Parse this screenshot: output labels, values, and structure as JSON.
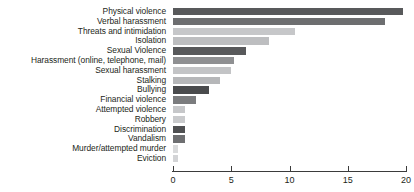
{
  "chart_data": {
    "type": "bar",
    "orientation": "horizontal",
    "title": "",
    "subtitle": "",
    "xlabel": "",
    "ylabel": "",
    "xlim": [
      0,
      20
    ],
    "grid": false,
    "legend": "none",
    "xticks": [
      "0",
      "5",
      "10",
      "15",
      "20"
    ],
    "xtick_values": [
      0,
      5,
      10,
      15,
      20
    ],
    "categories": [
      "Physical violence",
      "Verbal harassment",
      "Threats and intimidation",
      "Isolation",
      "Sexual Violence",
      "Harassment (online, telephone, mail)",
      "Sexual harassment",
      "Stalking",
      "Bullying",
      "Financial violence",
      "Attempted violence",
      "Robbery",
      "Discrimination",
      "Vandalism",
      "Murder/attempted murder",
      "Eviction"
    ],
    "values": [
      19.7,
      18.2,
      10.5,
      8.2,
      6.3,
      5.2,
      5.0,
      4.0,
      3.1,
      2.0,
      1.0,
      1.0,
      1.0,
      1.0,
      0.4,
      0.4
    ],
    "bar_colors": [
      "#58595b",
      "#6d6e70",
      "#c6c7c9",
      "#bdbec0",
      "#58595b",
      "#8f9092",
      "#c3c4c6",
      "#b6b7b9",
      "#4a4b4d",
      "#7b7c7e",
      "#c6c7c9",
      "#c9cacc",
      "#4f5052",
      "#6e6f71",
      "#d9dadb",
      "#d3d4d6"
    ],
    "axis_color": "#3b3b3b",
    "text_color": "#231f20",
    "background": "#ffffff"
  }
}
